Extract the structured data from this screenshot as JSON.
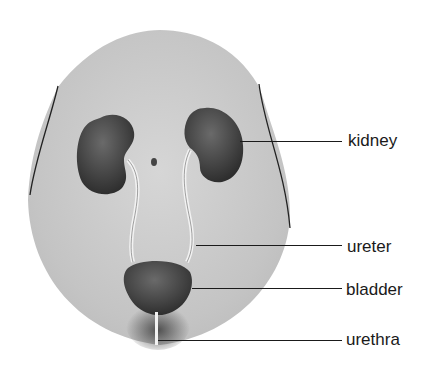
{
  "diagram": {
    "labels": [
      {
        "id": "kidney",
        "text": "kidney"
      },
      {
        "id": "ureter",
        "text": "ureter"
      },
      {
        "id": "bladder",
        "text": "bladder"
      },
      {
        "id": "urethra",
        "text": "urethra"
      }
    ]
  },
  "colors": {
    "body": "#c8c8c8",
    "organ": "#3c3c3c",
    "text": "#1a1a1a"
  }
}
